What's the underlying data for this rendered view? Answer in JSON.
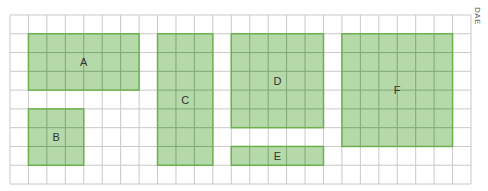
{
  "diagram": {
    "corner_label": "DAE",
    "grid": {
      "origin_x": 10,
      "origin_y": 15,
      "cols": 25,
      "rows": 9,
      "cell_w": 18.44,
      "cell_h": 18.78,
      "line_color": "#c9c9c9",
      "border_color": "#bdbdbd"
    },
    "colors": {
      "fill": "#b6d9a9",
      "stroke": "#6cb04f",
      "inner_line": "#7fa877",
      "label": "#333333"
    },
    "regions": [
      {
        "label": "A",
        "col": 1,
        "row": 1,
        "w": 6,
        "h": 3
      },
      {
        "label": "B",
        "col": 1,
        "row": 5,
        "w": 3,
        "h": 3
      },
      {
        "label": "C",
        "col": 8,
        "row": 1,
        "w": 3,
        "h": 7
      },
      {
        "label": "D",
        "col": 12,
        "row": 1,
        "w": 5,
        "h": 5
      },
      {
        "label": "E",
        "col": 12,
        "row": 7,
        "w": 5,
        "h": 1
      },
      {
        "label": "F",
        "col": 18,
        "row": 1,
        "w": 6,
        "h": 6
      }
    ]
  }
}
